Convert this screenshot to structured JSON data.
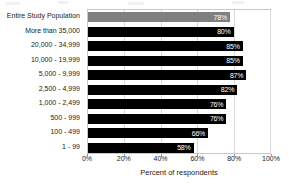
{
  "chart_data": {
    "type": "bar",
    "orientation": "horizontal",
    "title": "",
    "xlabel": "Percent of respondents",
    "ylabel": "",
    "xlim": [
      0,
      100
    ],
    "grid": true,
    "legend": "none",
    "value_suffix": "%",
    "categories": [
      "Entire Study Population",
      "More than 35,000",
      "20,000 - 34,999",
      "10,000 - 19,999",
      "5,000 - 9,999",
      "2,500 - 4,999",
      "1,000 - 2,499",
      "500 - 999",
      "100 - 499",
      "1 - 99"
    ],
    "values": [
      78,
      80,
      85,
      85,
      87,
      82,
      76,
      76,
      66,
      58
    ],
    "value_labels": [
      "78%",
      "80%",
      "85%",
      "85%",
      "87%",
      "82%",
      "76%",
      "76%",
      "66%",
      "58%"
    ],
    "xticks": [
      0,
      20,
      40,
      60,
      80,
      100
    ],
    "xticklabels": [
      "0%",
      "20%",
      "40%",
      "60%",
      "80%",
      "100%"
    ],
    "colors": {
      "bar": "#000000",
      "bar_accent": "#808080",
      "accent_index": 0,
      "value_text": "#ffffff",
      "gridline": "#d8d8d8",
      "frame": "#c8c8c8",
      "text": "#1a1a1a",
      "background": "#ffffff"
    }
  }
}
